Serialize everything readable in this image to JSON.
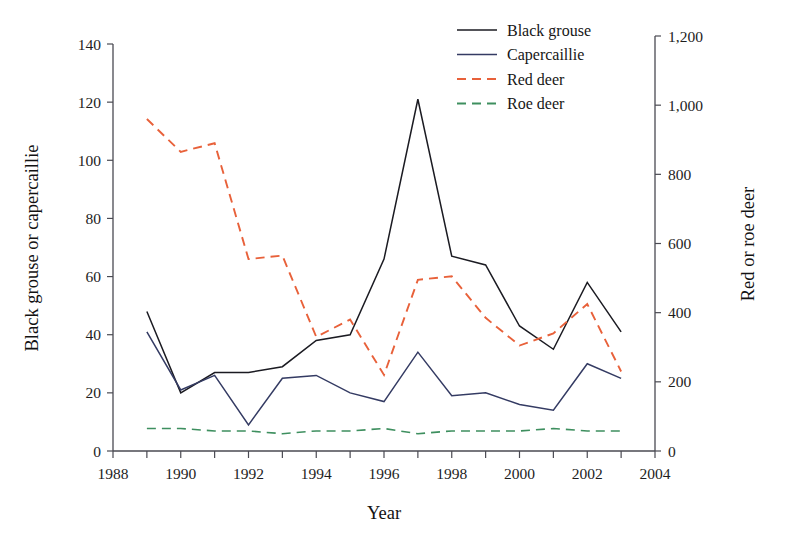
{
  "chart_data": {
    "type": "line",
    "title": "",
    "xlabel": "Year",
    "ylabel": "Black grouse or capercaillie",
    "y2label": "Red or roe deer",
    "xlim": [
      1988,
      2004
    ],
    "ylim": [
      0,
      140
    ],
    "y2lim": [
      0,
      1200
    ],
    "grid": false,
    "legend_position": "top-center",
    "x": [
      1989,
      1990,
      1991,
      1992,
      1993,
      1994,
      1995,
      1996,
      1997,
      1998,
      1999,
      2000,
      2001,
      2002,
      2003
    ],
    "xticks": [
      1988,
      1989,
      1990,
      1991,
      1992,
      1993,
      1994,
      1995,
      1996,
      1997,
      1998,
      1999,
      2000,
      2001,
      2002,
      2003,
      2004
    ],
    "xticklabels": [
      "1988",
      "1990",
      "1992",
      "1994",
      "1996",
      "1998",
      "2000",
      "2002",
      "2004"
    ],
    "xticklabel_values": [
      1988,
      1990,
      1992,
      1994,
      1996,
      1998,
      2000,
      2002,
      2004
    ],
    "yticks": [
      0,
      20,
      40,
      60,
      80,
      100,
      120,
      140
    ],
    "yticklabels": [
      "0",
      "20",
      "40",
      "60",
      "80",
      "100",
      "120",
      "140"
    ],
    "y2ticks": [
      0,
      200,
      400,
      600,
      800,
      1000,
      1200
    ],
    "y2ticklabels": [
      "0",
      "200",
      "400",
      "600",
      "800",
      "1,000",
      "1,200"
    ],
    "series": [
      {
        "name": "Black grouse",
        "axis": "left",
        "color": "#1b1b22",
        "dash": "none",
        "width": 1.5,
        "values": [
          48,
          20,
          27,
          27,
          29,
          38,
          40,
          66,
          121,
          67,
          64,
          43,
          35,
          58,
          41
        ]
      },
      {
        "name": "Capercaillie",
        "axis": "left",
        "color": "#343b63",
        "dash": "none",
        "width": 1.5,
        "values": [
          41,
          21,
          26,
          9,
          25,
          26,
          20,
          17,
          34,
          19,
          20,
          16,
          14,
          30,
          25
        ]
      },
      {
        "name": "Red deer",
        "axis": "right",
        "color": "#e8613a",
        "dash": "dashed",
        "width": 1.9,
        "values_left_scale": [
          116,
          105,
          108,
          69,
          70,
          45,
          51,
          34,
          65,
          66,
          52,
          43,
          47,
          57,
          35
        ],
        "values": [
          960,
          865,
          890,
          555,
          565,
          330,
          380,
          220,
          495,
          505,
          385,
          305,
          340,
          425,
          230
        ]
      },
      {
        "name": "Roe deer",
        "axis": "right",
        "color": "#3e8f5f",
        "dash": "dashed",
        "width": 1.6,
        "values_left_scale": [
          25,
          25,
          24,
          24,
          23,
          24,
          24,
          25,
          23,
          24,
          24,
          24,
          25,
          24,
          24
        ],
        "values": [
          65,
          65,
          58,
          58,
          50,
          58,
          58,
          65,
          50,
          58,
          58,
          58,
          65,
          58,
          58
        ]
      }
    ]
  },
  "legend": {
    "items": [
      {
        "label": "Black grouse",
        "color": "#1b1b22",
        "dash": "none"
      },
      {
        "label": "Capercaillie",
        "color": "#343b63",
        "dash": "none"
      },
      {
        "label": "Red deer",
        "color": "#e8613a",
        "dash": "dashed"
      },
      {
        "label": "Roe deer",
        "color": "#3e8f5f",
        "dash": "dashed"
      }
    ]
  },
  "axes": {
    "left_title": "Black grouse or capercaillie",
    "right_title": "Red or roe deer",
    "bottom_title": "Year"
  }
}
